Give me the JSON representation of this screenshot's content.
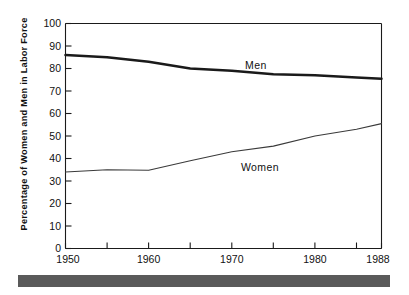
{
  "chart_data": {
    "type": "line",
    "title": "",
    "xlabel": "",
    "ylabel": "Percentage of Women and Men in Labor Force",
    "xlim": [
      1950,
      1988
    ],
    "ylim": [
      0,
      100
    ],
    "grid": false,
    "legend_position": "inline-annotation",
    "x": [
      1950,
      1955,
      1960,
      1965,
      1970,
      1975,
      1980,
      1985,
      1988
    ],
    "xticks": [
      1950,
      1955,
      1960,
      1965,
      1970,
      1975,
      1980,
      1985,
      1988
    ],
    "xtick_labels": [
      "1950",
      "",
      "1960",
      "",
      "1970",
      "",
      "1980",
      "",
      "1988"
    ],
    "yticks": [
      0,
      10,
      20,
      30,
      40,
      50,
      60,
      70,
      80,
      90,
      100
    ],
    "ytick_labels": [
      "0",
      "10",
      "20",
      "30",
      "40",
      "50",
      "60",
      "70",
      "80",
      "90",
      "100"
    ],
    "series": [
      {
        "name": "Men",
        "color": "#1a1a1a",
        "linewidth": "thick",
        "values": [
          86,
          85,
          83,
          80,
          79,
          77.5,
          77,
          76,
          75.5
        ],
        "label_text": "Men",
        "label_x": 1971,
        "label_y": 85
      },
      {
        "name": "Women",
        "color": "#3a3a3a",
        "linewidth": "thin",
        "values": [
          34,
          35,
          34.8,
          39,
          43,
          45.5,
          50,
          53,
          55.5
        ],
        "label_text": "Women",
        "label_x": 1971,
        "label_y": 36
      }
    ]
  },
  "axes": {
    "y_axis_title": "Percentage of Women and Men in Labor Force"
  },
  "annotations": {
    "men_label": "Men",
    "women_label": "Women"
  },
  "ytick_labels": {
    "t0": "0",
    "t1": "10",
    "t2": "20",
    "t3": "30",
    "t4": "40",
    "t5": "50",
    "t6": "60",
    "t7": "70",
    "t8": "80",
    "t9": "90",
    "t10": "100"
  },
  "xtick_labels": {
    "t1950": "1950",
    "t1960": "1960",
    "t1970": "1970",
    "t1980": "1980",
    "t1988": "1988"
  }
}
